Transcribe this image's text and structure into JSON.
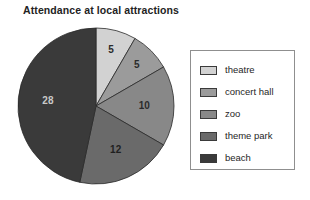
{
  "chart_data": {
    "type": "pie",
    "title": "Attendance at local attractions",
    "categories": [
      "theatre",
      "concert hall",
      "zoo",
      "theme park",
      "beach"
    ],
    "values": [
      5,
      5,
      10,
      12,
      28
    ],
    "labels": [
      "5",
      "5",
      "10",
      "12",
      "28"
    ],
    "total": 60,
    "colors": [
      "#d2d2d2",
      "#9b9b9b",
      "#888888",
      "#6a6a6a",
      "#3a3a3a"
    ],
    "label_colors": [
      "#2b2b2b",
      "#2b2b2b",
      "#2b2b2b",
      "#1f1f1f",
      "#c9c9c9"
    ],
    "start_angle_deg": 0,
    "direction": "clockwise",
    "legend_position": "right",
    "grid": false,
    "xlabel": "",
    "ylabel": ""
  },
  "legend": {
    "items": [
      {
        "label": "theatre",
        "color": "#d2d2d2"
      },
      {
        "label": "concert hall",
        "color": "#9b9b9b"
      },
      {
        "label": "zoo",
        "color": "#888888"
      },
      {
        "label": "theme park",
        "color": "#6a6a6a"
      },
      {
        "label": "beach",
        "color": "#3a3a3a"
      }
    ]
  }
}
